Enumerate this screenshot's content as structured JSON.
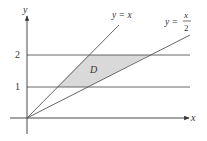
{
  "diagram": {
    "axes": {
      "x_label": "x",
      "y_label": "y"
    },
    "y_ticks": [
      {
        "label": "1"
      },
      {
        "label": "2"
      }
    ],
    "curves": [
      {
        "name": "y = x",
        "label": "y = x"
      },
      {
        "name": "y = x/2",
        "label_lhs": "y =",
        "label_num": "x",
        "label_den": "2"
      }
    ],
    "horizontal_lines": [
      "y = 1",
      "y = 2"
    ],
    "region": {
      "label": "D",
      "fill": "#d9d9d9"
    },
    "colors": {
      "line": "#555555",
      "axis": "#333333"
    }
  }
}
